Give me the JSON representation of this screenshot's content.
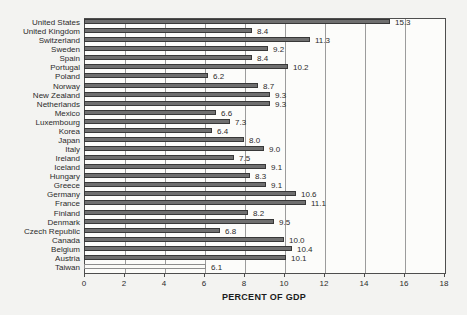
{
  "chart_data": {
    "type": "bar",
    "orientation": "horizontal",
    "title": "",
    "xlabel": "PERCENT OF GDP",
    "ylabel": "",
    "xlim": [
      0,
      18
    ],
    "x_ticks": [
      0,
      2,
      4,
      6,
      8,
      10,
      12,
      14,
      16,
      18
    ],
    "grid": "vertical gridlines every 2 units",
    "legend": "none",
    "value_labels_shown": true,
    "categories": [
      "United States",
      "United Kingdom",
      "Switzerland",
      "Sweden",
      "Spain",
      "Portugal",
      "Poland",
      "Norway",
      "New Zealand",
      "Netherlands",
      "Mexico",
      "Luxembourg",
      "Korea",
      "Japan",
      "Italy",
      "Ireland",
      "Iceland",
      "Hungary",
      "Greece",
      "Germany",
      "France",
      "Finland",
      "Denmark",
      "Czech Republic",
      "Canada",
      "Belgium",
      "Austria",
      "Taiwan"
    ],
    "values": [
      15.3,
      8.4,
      11.3,
      9.2,
      8.4,
      10.2,
      6.2,
      8.7,
      9.3,
      9.3,
      6.6,
      7.3,
      6.4,
      8.0,
      9.0,
      7.5,
      9.1,
      8.3,
      9.1,
      10.6,
      11.1,
      8.2,
      9.5,
      6.8,
      10.0,
      10.4,
      10.1,
      6.1
    ],
    "bar_color": "#6f6f6f",
    "bar_border_color": "#383838",
    "highlight_category": "Taiwan",
    "highlight_color": "#fbfbf8",
    "highlight_border_color": "#8d8d8d",
    "gridline_color": "#9c9c9c",
    "axis_border_color": "#4e4e4e"
  }
}
